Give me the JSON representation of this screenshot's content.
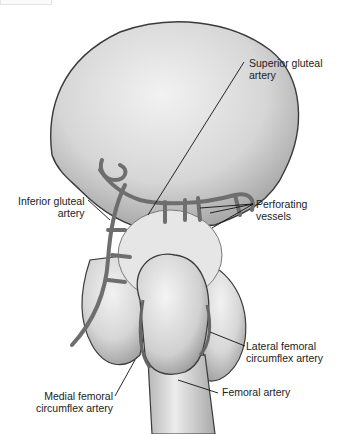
{
  "figure": {
    "colors": {
      "bone_fill": "#d9d9d9",
      "bone_shade": "#b5b5b5",
      "artery": "#6e6e6e",
      "outline": "#3a3a3a",
      "leader": "#111111"
    }
  },
  "labels": {
    "superior_gluteal": {
      "line1": "Superior gluteal",
      "line2": "artery"
    },
    "inferior_gluteal": {
      "line1": "Inferior gluteal",
      "line2": "artery"
    },
    "perforating": {
      "line1": "Perforating",
      "line2": "vessels"
    },
    "lateral_femoral": {
      "line1": "Lateral femoral",
      "line2": "circumflex artery"
    },
    "femoral": {
      "line1": "Femoral artery"
    },
    "medial_femoral": {
      "line1": "Medial femoral",
      "line2": "circumflex artery"
    }
  }
}
